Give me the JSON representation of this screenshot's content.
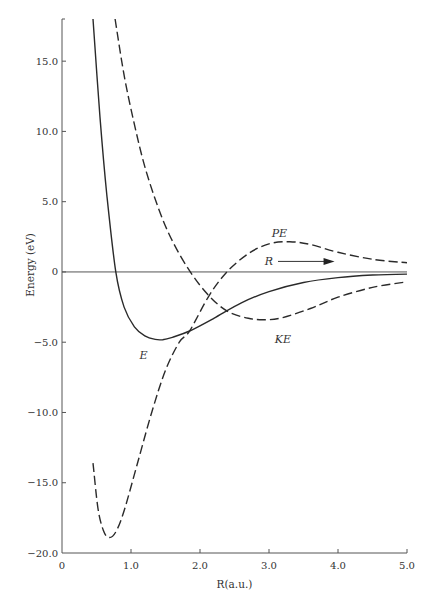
{
  "chart_data": {
    "type": "line",
    "title": "",
    "xlabel": "R(a.u.)",
    "ylabel": "Energy (eV)",
    "xlim": [
      0,
      5.0
    ],
    "ylim": [
      -20.0,
      18.0
    ],
    "xticks": [
      0,
      1.0,
      2.0,
      3.0,
      4.0,
      5.0
    ],
    "xtick_labels": [
      "0",
      "1.0",
      "2.0",
      "3.0",
      "4.0",
      "5.0"
    ],
    "yticks": [
      15.0,
      10.0,
      5.0,
      0,
      -5.0,
      -10.0,
      -15.0,
      -20.0
    ],
    "ytick_labels": [
      "15.0",
      "10.0",
      "5.0",
      "0",
      "−5.0",
      "−10.0",
      "−15.0",
      "−20.0"
    ],
    "grid": false,
    "zero_line": true,
    "series": [
      {
        "name": "E",
        "label": "E",
        "style": "solid",
        "x": [
          0.45,
          0.55,
          0.65,
          0.78,
          0.9,
          1.05,
          1.2,
          1.35,
          1.46,
          1.6,
          1.85,
          2.2,
          2.6,
          3.0,
          3.5,
          4.0,
          4.5,
          5.0
        ],
        "y": [
          18.0,
          11.0,
          5.5,
          0.0,
          -2.5,
          -3.9,
          -4.55,
          -4.8,
          -4.82,
          -4.65,
          -4.2,
          -3.3,
          -2.2,
          -1.4,
          -0.75,
          -0.4,
          -0.22,
          -0.15
        ]
      },
      {
        "name": "KE",
        "label": "KE",
        "style": "dashed",
        "x": [
          0.77,
          0.9,
          1.05,
          1.2,
          1.4,
          1.6,
          1.86,
          2.13,
          2.4,
          2.7,
          2.95,
          3.2,
          3.6,
          4.0,
          4.5,
          5.0
        ],
        "y": [
          18.0,
          14.0,
          10.5,
          7.5,
          4.5,
          2.2,
          0.0,
          -1.7,
          -2.8,
          -3.3,
          -3.4,
          -3.25,
          -2.6,
          -1.8,
          -1.1,
          -0.7
        ]
      },
      {
        "name": "PE",
        "label": "PE",
        "style": "dashed",
        "x": [
          0.45,
          0.52,
          0.6,
          0.68,
          0.78,
          0.9,
          1.1,
          1.3,
          1.5,
          1.7,
          1.85,
          2.13,
          2.39,
          2.7,
          3.0,
          3.3,
          3.6,
          4.0,
          4.5,
          5.0
        ],
        "y": [
          -13.6,
          -16.8,
          -18.4,
          -18.9,
          -18.5,
          -17.0,
          -13.5,
          -10.0,
          -7.0,
          -5.0,
          -4.2,
          -1.7,
          0.0,
          1.3,
          2.0,
          2.15,
          1.95,
          1.4,
          0.9,
          0.65
        ]
      }
    ],
    "annotations": [
      {
        "text": "E",
        "x": 1.18,
        "y": -5.9,
        "italic": true
      },
      {
        "text": "KE",
        "x": 3.2,
        "y": -4.8,
        "italic": true
      },
      {
        "text": "PE",
        "x": 3.15,
        "y": 2.75,
        "italic": true
      },
      {
        "text": "R",
        "x": 3.0,
        "y": 0.75,
        "italic": true,
        "arrow_to_x": 3.95
      }
    ]
  }
}
